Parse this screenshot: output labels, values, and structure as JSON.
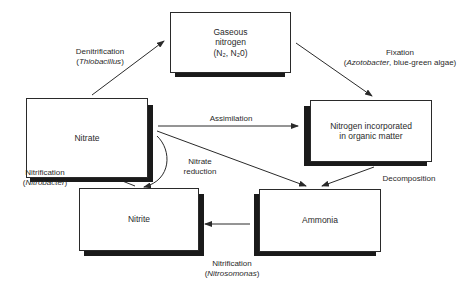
{
  "diagram": {
    "nodes": {
      "gaseous_nitrogen": {
        "line1": "Gaseous",
        "line2": "nitrogen",
        "line3": "(N₂, N₂0)"
      },
      "nitrate": {
        "label": "Nitrate"
      },
      "organic": {
        "line1": "Nitrogen incorporated",
        "line2": "in organic matter"
      },
      "nitrite": {
        "label": "Nitrite"
      },
      "ammonia": {
        "label": "Ammonia"
      }
    },
    "edges": {
      "denitrification": {
        "process": "Denitrification",
        "organism": "Thiobacillus",
        "from": "Nitrate",
        "to": "Gaseous nitrogen"
      },
      "fixation": {
        "process": "Fixation",
        "organism": "Azotobacter",
        "extra": ", blue-green algae",
        "from": "Gaseous nitrogen",
        "to": "Nitrogen incorporated in organic matter"
      },
      "assimilation": {
        "process": "Assimilation",
        "from": "Nitrate",
        "to": "Nitrogen incorporated in organic matter"
      },
      "nitrate_reduction": {
        "line1": "Nitrate",
        "line2": "reduction",
        "from": "Nitrate",
        "to": "Nitrite"
      },
      "decomposition": {
        "process": "Decomposition",
        "from": "Nitrogen incorporated in organic matter",
        "to": "Ammonia"
      },
      "nitrate_to_ammonia": {
        "from": "Nitrate",
        "to": "Ammonia"
      },
      "nitrification_nitrobacter": {
        "process": "Nitrification",
        "organism": "Nitrobacter",
        "from": "Nitrite",
        "to": "Nitrate"
      },
      "nitrification_nitrosomonas": {
        "process": "Nitrification",
        "organism": "Nitrosomonas",
        "from": "Ammonia",
        "to": "Nitrite"
      }
    }
  }
}
